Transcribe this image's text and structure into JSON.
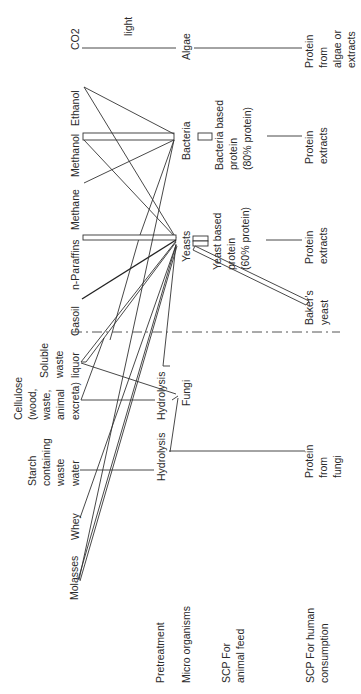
{
  "orientation": "rotated 90 degrees counter-clockwise",
  "row_labels": {
    "pretreatment": "Pretreatment",
    "micro_organisms": "Micro organisms",
    "scp_animal_feed": [
      "SCP For",
      "animal feed"
    ],
    "scp_human_consumption": [
      "SCP For human",
      "consumption"
    ]
  },
  "substrates": {
    "co2": "CO2",
    "ethanol": "Ethanol",
    "methanol": "Methanol",
    "methane": "Methane",
    "n_paraffins": "n-Paraffins",
    "gasoil": "Gasoil",
    "soluble_waste_liquor": [
      "Soluble",
      "waste",
      "liquor"
    ],
    "cellulose": [
      "Cellulose",
      "(wood,",
      "waste,",
      "animal",
      "excreta)"
    ],
    "starch_waste_water": [
      "Starch",
      "containing",
      "waste",
      "water"
    ],
    "whey": "Whey",
    "molasses": "Molasses"
  },
  "pretreatment": {
    "light": "light",
    "hydrolysis_cellulose": "Hydrolysis",
    "hydrolysis_starch": "Hydrolysis"
  },
  "micro_organisms": {
    "algae": "Algae",
    "bacteria": "Bacteria",
    "yeasts": "Yeasts",
    "bakers_yeast": [
      "Baker's",
      "yeast"
    ],
    "fungi": "Fungi"
  },
  "animal_feed": {
    "bacteria_protein": [
      "Bacteria based",
      "protein",
      "(80% protein)"
    ],
    "yeast_protein": [
      "Yeast based",
      "protein",
      "(60% protein)"
    ]
  },
  "human_consumption": {
    "algae_protein": [
      "Protein",
      "from",
      "algae or",
      "extracts"
    ],
    "bacteria_extracts": [
      "Protein",
      "extracts"
    ],
    "yeast_extracts": [
      "Protein",
      "extracts"
    ],
    "fungi_protein": [
      "Protein",
      "from",
      "fungi"
    ]
  },
  "connections": [
    {
      "from": "CO2",
      "via": "light",
      "to": "Algae"
    },
    {
      "from": "Algae",
      "to": "Protein from algae or extracts"
    },
    {
      "from": "Ethanol",
      "to": "Bacteria"
    },
    {
      "from": "Ethanol",
      "to": "Yeasts"
    },
    {
      "from": "Methanol",
      "to": "Bacteria"
    },
    {
      "from": "Methanol",
      "to": "Yeasts"
    },
    {
      "from": "Methane",
      "to": "Bacteria"
    },
    {
      "from": "n-Paraffins",
      "to": "Yeasts"
    },
    {
      "from": "Gasoil",
      "to": "Yeasts"
    },
    {
      "from": "Soluble waste liquor",
      "to": "Yeasts"
    },
    {
      "from": "Soluble waste liquor",
      "to": "Fungi"
    },
    {
      "from": "Cellulose",
      "via": "Hydrolysis",
      "to": "Yeasts"
    },
    {
      "from": "Cellulose",
      "via": "Hydrolysis",
      "to": "Fungi"
    },
    {
      "from": "Starch containing waste water",
      "via": "Hydrolysis",
      "to": "Fungi"
    },
    {
      "from": "Whey",
      "to": "Yeasts"
    },
    {
      "from": "Molasses",
      "to": "Yeasts"
    },
    {
      "from": "Molasses",
      "to": "Bacteria"
    },
    {
      "from": "Bacteria",
      "to": "Bacteria based protein (80% protein)"
    },
    {
      "from": "Bacteria based protein (80% protein)",
      "to": "Protein extracts"
    },
    {
      "from": "Yeasts",
      "to": "Yeast based protein (60% protein)"
    },
    {
      "from": "Yeast based protein (60% protein)",
      "to": "Protein extracts"
    },
    {
      "from": "Yeasts",
      "to": "Baker's yeast"
    },
    {
      "from": "Fungi",
      "to": "Protein from fungi"
    }
  ]
}
